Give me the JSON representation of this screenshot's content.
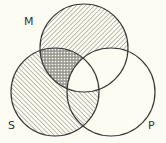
{
  "diagram": {
    "type": "venn-3",
    "background": "#fcfcf2",
    "stroke_color": "#3a3a3a",
    "hatch_color": "#8a8a80",
    "circles": [
      {
        "id": "M",
        "label": "M",
        "cx": 84,
        "cy": 48,
        "r": 44,
        "label_x": 24,
        "label_y": 25
      },
      {
        "id": "S",
        "label": "S",
        "cx": 55,
        "cy": 92,
        "r": 44,
        "label_x": 8,
        "label_y": 129
      },
      {
        "id": "P",
        "label": "P",
        "cx": 111,
        "cy": 92,
        "r": 44,
        "label_x": 148,
        "label_y": 129
      }
    ],
    "regions": [
      {
        "name": "M only",
        "fill": "hatch-forward"
      },
      {
        "name": "S only",
        "fill": "hatch-backward"
      },
      {
        "name": "P only",
        "fill": "none"
      },
      {
        "name": "M and S not P",
        "fill": "dotted"
      },
      {
        "name": "S and P not M",
        "fill": "hatch-backward"
      },
      {
        "name": "M and P not S",
        "fill": "none"
      },
      {
        "name": "M and S and P",
        "fill": "none"
      }
    ]
  }
}
